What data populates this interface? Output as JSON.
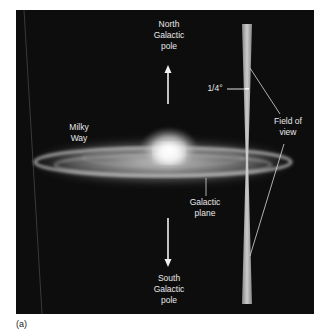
{
  "figure": {
    "caption_label": "(a)",
    "labels": {
      "north_pole": [
        "North",
        "Galactic",
        "pole"
      ],
      "south_pole": [
        "South",
        "Galactic",
        "pole"
      ],
      "milky_way": [
        "Milky",
        "Way"
      ],
      "galactic_plane": [
        "Galactic",
        "plane"
      ],
      "field_of_view": [
        "Field of",
        "view"
      ],
      "angle": "1/4°"
    },
    "colors": {
      "background": "#0d0d0d",
      "text": "#e8e8e8",
      "galaxy_glow": "#f2f2f2"
    }
  }
}
